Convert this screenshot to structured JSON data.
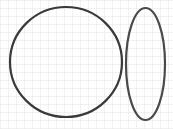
{
  "canvas": {
    "width": 173,
    "height": 129,
    "background": "#ffffff"
  },
  "grid": {
    "spacing": 8,
    "color": "#e3e3e3"
  },
  "shapes": [
    {
      "type": "circle",
      "label": "circle",
      "cx": 66,
      "cy": 62,
      "rx": 56,
      "ry": 55,
      "stroke": "#3a3a3a",
      "stroke_width": 2.2
    },
    {
      "type": "ellipse",
      "label": "tall-ellipse",
      "cx": 145.5,
      "cy": 64,
      "rx": 19.5,
      "ry": 56,
      "stroke": "#4a4a4a",
      "stroke_width": 2.2
    }
  ]
}
